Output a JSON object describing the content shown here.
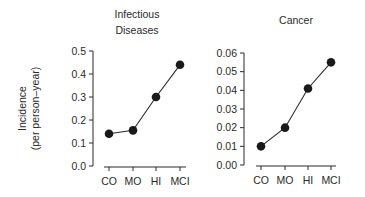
{
  "chart_data": [
    {
      "type": "line",
      "title": "Infectious Diseases",
      "title_lines": [
        "Infectious",
        "Diseases"
      ],
      "xlabel": "",
      "ylabel": "Incidence (per person–year)",
      "ylabel_lines": [
        "Incidence",
        "(per person–year)"
      ],
      "categories": [
        "CO",
        "MO",
        "HI",
        "MCI"
      ],
      "values": [
        0.14,
        0.155,
        0.3,
        0.44
      ],
      "ylim": [
        0.0,
        0.5
      ],
      "yticks": [
        "0.0",
        "0.1",
        "0.2",
        "0.3",
        "0.4",
        "0.5"
      ],
      "grid": false,
      "marker": "filled-circle"
    },
    {
      "type": "line",
      "title": "Cancer",
      "xlabel": "",
      "ylabel": "",
      "categories": [
        "CO",
        "MO",
        "HI",
        "MCI"
      ],
      "values": [
        0.01,
        0.02,
        0.041,
        0.055
      ],
      "ylim": [
        0.0,
        0.06
      ],
      "yticks": [
        "0.00",
        "0.01",
        "0.02",
        "0.03",
        "0.04",
        "0.05",
        "0.06"
      ],
      "grid": false,
      "marker": "filled-circle"
    }
  ],
  "colors": {
    "line": "#2a2a2a",
    "marker": "#1a1a1a",
    "text": "#2a2a2a"
  }
}
